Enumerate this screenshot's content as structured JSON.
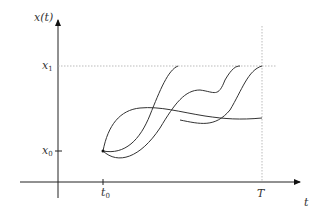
{
  "diagram": {
    "y_axis_label": "x(t)",
    "x_axis_label": "t",
    "x1_label": "x",
    "x1_sub": "1",
    "x0_label": "x",
    "x0_sub": "0",
    "t0_label": "t",
    "t0_sub": "0",
    "T_label": "T",
    "curve_count": 3,
    "colors": {
      "line": "#333333",
      "guide": "#bbbbbb"
    }
  }
}
